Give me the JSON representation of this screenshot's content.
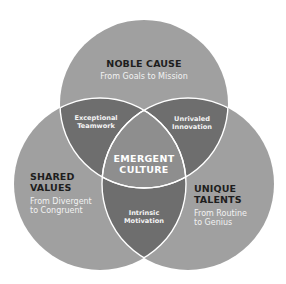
{
  "colors": {
    "single": "#a0a0a0",
    "pair": "#6e6e6e",
    "center": "#8e8e8e",
    "stroke": "#ffffff",
    "title_text": "#1e1e1e",
    "sub_text": "#f2f2f2"
  },
  "circles": [
    {
      "id": "noble-cause",
      "title": "NOBLE CAUSE",
      "subtitle": "From Goals to Mission"
    },
    {
      "id": "shared-values",
      "title_line1": "SHARED",
      "title_line2": "VALUES",
      "subtitle_line1": "From Divergent",
      "subtitle_line2": "to Congruent"
    },
    {
      "id": "unique-talents",
      "title_line1": "UNIQUE",
      "title_line2": "TALENTS",
      "subtitle_line1": "From Routine",
      "subtitle_line2": "to Genius"
    }
  ],
  "overlaps": {
    "noble_shared": {
      "line1": "Exceptional",
      "line2": "Teamwork"
    },
    "noble_unique": {
      "line1": "Unrivaled",
      "line2": "Innovation"
    },
    "shared_unique": {
      "line1": "Intrinsic",
      "line2": "Motivation"
    }
  },
  "center": {
    "line1": "EMERGENT",
    "line2": "CULTURE"
  }
}
